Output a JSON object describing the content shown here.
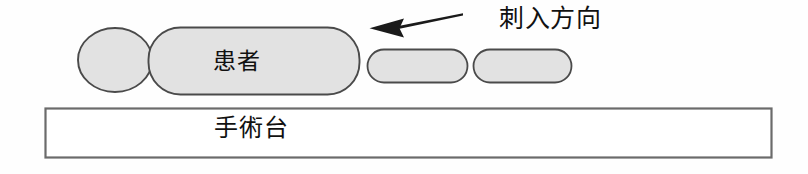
{
  "figure": {
    "background_color": "#fefefe",
    "shape_fill_color": "#e2e2e2",
    "shape_stroke_color": "#4a4a4a",
    "table_fill_color": "#ffffff",
    "table_stroke_color": "#6b6b6b",
    "arrow_color": "#1a1a1a",
    "text_color": "#111111"
  },
  "labels": {
    "patient": "患者",
    "operating_table": "手術台",
    "insertion_direction": "刺入方向"
  },
  "shapes": {
    "head": {
      "name": "head-ellipse",
      "cx": 115,
      "cy": 60,
      "rx": 37,
      "ry": 32
    },
    "torso": {
      "name": "torso-rounded-rectangle",
      "x": 148,
      "y": 27,
      "width": 212,
      "height": 68,
      "radius": 32
    },
    "leg_upper": {
      "name": "leg-segment-upper",
      "x": 367,
      "y": 49,
      "width": 101,
      "height": 34,
      "radius": 17
    },
    "leg_lower": {
      "name": "leg-segment-lower",
      "x": 473,
      "y": 49,
      "width": 99,
      "height": 34,
      "radius": 17
    },
    "table": {
      "name": "operating-table-rectangle",
      "x": 45,
      "y": 108,
      "width": 727,
      "height": 50
    },
    "arrow": {
      "name": "insertion-direction-arrow",
      "tip_x": 370,
      "tip_y": 28,
      "tail_x": 463,
      "tail_y": 14
    }
  }
}
